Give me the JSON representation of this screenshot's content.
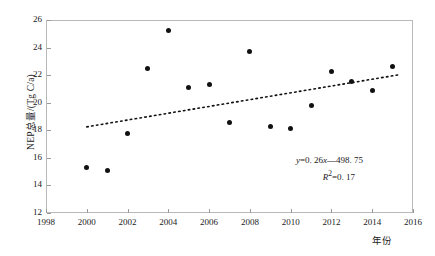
{
  "chart_data": {
    "type": "scatter",
    "title": "",
    "xlabel": "年份",
    "ylabel": "NEP总量/(Tg C/a)",
    "xlim": [
      1998,
      2016
    ],
    "ylim": [
      12,
      26
    ],
    "xticks": [
      1998,
      2000,
      2002,
      2004,
      2006,
      2008,
      2010,
      2012,
      2014,
      2016
    ],
    "yticks": [
      12,
      14,
      16,
      18,
      20,
      22,
      24,
      26
    ],
    "xtick_labels": [
      "1998",
      "2000",
      "2002",
      "2004",
      "2006",
      "2008",
      "2010",
      "2012",
      "2014",
      "2016"
    ],
    "ytick_labels": [
      "12",
      "14",
      "16",
      "18",
      "20",
      "22",
      "24",
      "26"
    ],
    "grid": false,
    "legend": "none",
    "x": [
      2000,
      2001,
      2002,
      2003,
      2004,
      2005,
      2006,
      2007,
      2008,
      2009,
      2010,
      2011,
      2012,
      2013,
      2014,
      2015
    ],
    "values": [
      15.3,
      15.05,
      17.8,
      22.5,
      25.25,
      21.1,
      21.35,
      18.6,
      23.75,
      18.25,
      18.1,
      19.8,
      22.3,
      21.55,
      20.85,
      22.6
    ],
    "series": [
      {
        "name": "NEP总量",
        "marker": "filled-circle",
        "color": "#111111",
        "points": [
          {
            "x": 2000,
            "y": 15.3
          },
          {
            "x": 2001,
            "y": 15.05
          },
          {
            "x": 2002,
            "y": 17.8
          },
          {
            "x": 2003,
            "y": 22.5
          },
          {
            "x": 2004,
            "y": 25.25
          },
          {
            "x": 2005,
            "y": 21.1
          },
          {
            "x": 2006,
            "y": 21.35
          },
          {
            "x": 2007,
            "y": 18.6
          },
          {
            "x": 2008,
            "y": 23.75
          },
          {
            "x": 2009,
            "y": 18.25
          },
          {
            "x": 2010,
            "y": 18.1
          },
          {
            "x": 2011,
            "y": 19.8
          },
          {
            "x": 2012,
            "y": 22.3
          },
          {
            "x": 2013,
            "y": 21.55
          },
          {
            "x": 2014,
            "y": 20.85
          },
          {
            "x": 2015,
            "y": 22.6
          }
        ]
      }
    ],
    "trendline": {
      "style": "dotted",
      "color": "#111111",
      "slope": 0.26,
      "intercept": -498.75,
      "x_start": 2000,
      "x_end": 2015.4,
      "y_start": 18.25,
      "y_end": 22.05
    },
    "annotations": {
      "equation": "y=0. 26x—498. 75",
      "equation_y": "y",
      "equation_rest": "=0. 26",
      "equation_x": "x",
      "equation_tail": "—498. 75",
      "r_squared_symbol": "R",
      "r_squared_exp": "2",
      "r_squared_value": "=0. 17"
    }
  }
}
